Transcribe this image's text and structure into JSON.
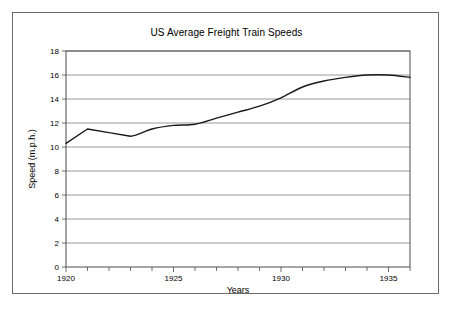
{
  "figure": {
    "border_color": "#6b6b6b",
    "background": "#ffffff"
  },
  "chart_data": {
    "type": "line",
    "title": "US Average Freight Train Speeds",
    "xlabel": "Years",
    "ylabel": "Speed (m.p.h.)",
    "xlim": [
      1920,
      1936
    ],
    "ylim": [
      0,
      18
    ],
    "ytick_labels": [
      "0",
      "2",
      "4",
      "6",
      "8",
      "10",
      "12",
      "14",
      "16",
      "18"
    ],
    "yticks": [
      0,
      2,
      4,
      6,
      8,
      10,
      12,
      14,
      16,
      18
    ],
    "xtick_labels": [
      "1920",
      "1925",
      "1930",
      "1935"
    ],
    "xticks": [
      1920,
      1925,
      1930,
      1935
    ],
    "minor_xticks": [
      1921,
      1922,
      1923,
      1924,
      1926,
      1927,
      1928,
      1929,
      1931,
      1932,
      1933,
      1934,
      1936
    ],
    "grid": "horizontal",
    "legend": "none",
    "line_color": "#1a1a1a",
    "x": [
      1920,
      1921,
      1922,
      1923,
      1924,
      1925,
      1926,
      1927,
      1928,
      1929,
      1930,
      1931,
      1932,
      1933,
      1934,
      1935,
      1936
    ],
    "values": [
      10.3,
      11.5,
      11.2,
      10.9,
      11.5,
      11.8,
      11.9,
      12.4,
      12.9,
      13.4,
      14.1,
      15.0,
      15.5,
      15.8,
      16.0,
      16.0,
      15.8
    ],
    "series": [
      {
        "name": "Average freight train speed",
        "values": [
          10.3,
          11.5,
          11.2,
          10.9,
          11.5,
          11.8,
          11.9,
          12.4,
          12.9,
          13.4,
          14.1,
          15.0,
          15.5,
          15.8,
          16.0,
          16.0,
          15.8
        ]
      }
    ]
  }
}
